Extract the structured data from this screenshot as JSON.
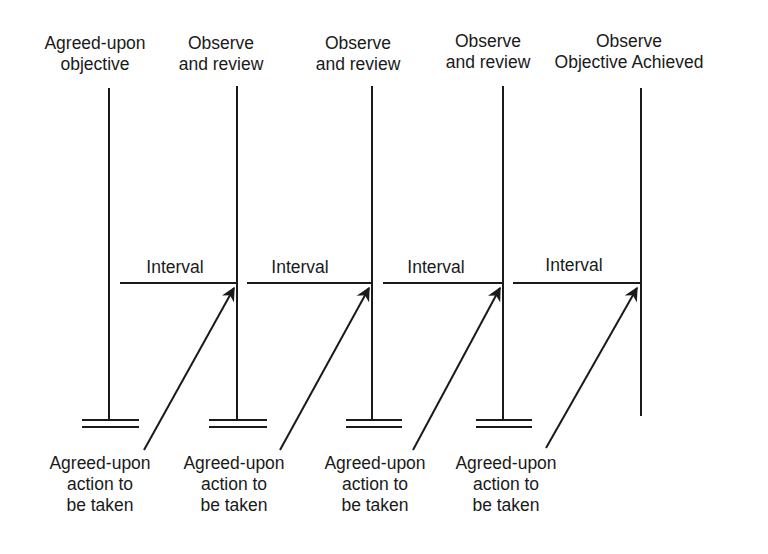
{
  "top_labels": [
    {
      "line1": "Agreed-upon",
      "line2": "objective",
      "x": 95
    },
    {
      "line1": "Observe",
      "line2": "and review",
      "x": 221
    },
    {
      "line1": "Observe",
      "line2": "and review",
      "x": 358
    },
    {
      "line1": "Observe",
      "line2": "and review",
      "x": 488
    },
    {
      "line1": "Observe",
      "line2": "Objective Achieved",
      "x": 629
    }
  ],
  "intervals": [
    {
      "label": "Interval",
      "x": 175
    },
    {
      "label": "Interval",
      "x": 300
    },
    {
      "label": "Interval",
      "x": 436
    },
    {
      "label": "Interval",
      "x": 574
    }
  ],
  "bottom_labels": [
    {
      "line1": "Agreed-upon",
      "line2": "action to",
      "line3": "be taken",
      "x": 100
    },
    {
      "line1": "Agreed-upon",
      "line2": "action to",
      "line3": "be taken",
      "x": 234
    },
    {
      "line1": "Agreed-upon",
      "line2": "action to",
      "line3": "be taken",
      "x": 375
    },
    {
      "line1": "Agreed-upon",
      "line2": "action to",
      "line3": "be taken",
      "x": 506
    }
  ],
  "colors": {
    "ink": "#1a1a1a",
    "background": "#ffffff"
  }
}
